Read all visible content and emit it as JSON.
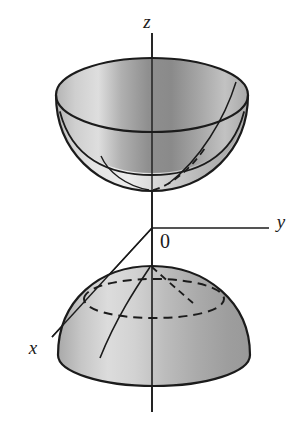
{
  "figure": {
    "background_color": "#ffffff",
    "stroke_color": "#1b1b1b",
    "surface_fill_light": "#e9e9e9",
    "surface_fill_mid": "#b9b9b9",
    "surface_fill_dark": "#8a8a8a",
    "width": 303,
    "height": 426
  },
  "axes": {
    "origin_label": "0",
    "origin_point": {
      "x": 152,
      "y": 228
    },
    "z": {
      "label": "z",
      "label_x": 147,
      "label_y": 28,
      "line": {
        "x1": 152,
        "y1": 33,
        "x2": 152,
        "y2": 412
      }
    },
    "y": {
      "label": "y",
      "label_x": 279,
      "label_y": 228,
      "line": {
        "x1": 152,
        "y1": 228,
        "x2": 269,
        "y2": 228
      }
    },
    "x": {
      "label": "x",
      "label_x": 33,
      "label_y": 354,
      "line": {
        "x1": 152,
        "y1": 228,
        "x2": 52,
        "y2": 337
      }
    }
  },
  "upper_sheet": {
    "name": "upper-sheet-bowl",
    "rim_center": {
      "x": 152,
      "y": 95
    },
    "rim_rx": 96,
    "rim_ry": 37,
    "vertex": {
      "x": 152,
      "y": 191
    },
    "inner_cross_section_y": 152,
    "inner_rx": 62,
    "inner_ry": 18
  },
  "lower_sheet": {
    "name": "lower-sheet-dome",
    "apex": {
      "x": 152,
      "y": 266
    },
    "base_center": {
      "x": 154,
      "y": 355
    },
    "base_rx": 96,
    "base_ry": 31,
    "dashed_cross_section_y": 297,
    "dashed_rx": 70,
    "dashed_ry": 20
  },
  "curves": {
    "upper_meridian_solid": "solid meridian on right face of bowl",
    "upper_meridian_dashed": "hidden meridian behind bowl",
    "lower_meridian_solid": "solid meridian on left face of dome",
    "lower_meridian_dashed": "hidden meridian on dome",
    "lower_dashed_ellipse": "hidden horizontal cross-section of dome"
  }
}
